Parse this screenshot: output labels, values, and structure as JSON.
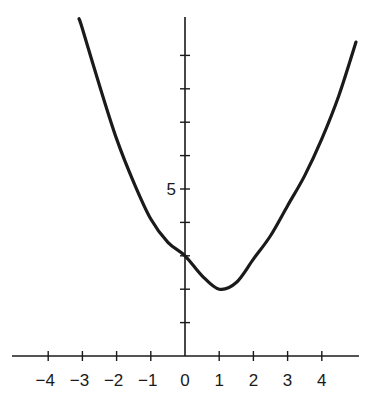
{
  "chart_data": {
    "type": "line",
    "title": "",
    "xlabel": "",
    "ylabel": "",
    "xlim": [
      -4.8,
      5.3
    ],
    "ylim": [
      0,
      10
    ],
    "grid": false,
    "legend": "none",
    "x_ticks": [
      -4,
      -3,
      -2,
      -1,
      0,
      1,
      2,
      3,
      4
    ],
    "x_tick_labels": [
      "−4",
      "−3",
      "−2",
      "−1",
      "0",
      "1",
      "2",
      "3",
      "4"
    ],
    "y_ticks": [
      1,
      2,
      3,
      4,
      5,
      6,
      7,
      8,
      9
    ],
    "y_tick_labels": [
      {
        "value": 5,
        "label": "5"
      }
    ],
    "series": [
      {
        "name": "curve",
        "color": "#1a1a1a",
        "x": [
          -3.1,
          -3,
          -2.5,
          -2,
          -1.5,
          -1,
          -0.5,
          0,
          0.5,
          1,
          1.5,
          2,
          2.5,
          3,
          3.5,
          4,
          4.5,
          5
        ],
        "y": [
          10.1,
          9.8,
          8.1,
          6.5,
          5.2,
          4.1,
          3.4,
          3.0,
          2.4,
          2.0,
          2.2,
          2.9,
          3.6,
          4.5,
          5.4,
          6.5,
          7.8,
          9.4
        ]
      }
    ]
  }
}
